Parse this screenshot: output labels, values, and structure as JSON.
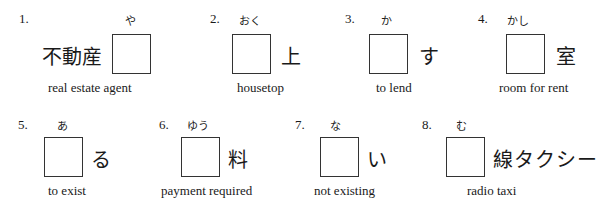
{
  "items": [
    {
      "number": "1.",
      "furigana": "や",
      "before": "不動産",
      "after": "",
      "meaning": "real estate agent"
    },
    {
      "number": "2.",
      "furigana": "おく",
      "before": "",
      "after": "上",
      "meaning": "housetop"
    },
    {
      "number": "3.",
      "furigana": "か",
      "before": "",
      "after": "す",
      "meaning": "to lend"
    },
    {
      "number": "4.",
      "furigana": "かし",
      "before": "",
      "after": "室",
      "meaning": "room for rent"
    },
    {
      "number": "5.",
      "furigana": "あ",
      "before": "",
      "after": "る",
      "meaning": "to exist"
    },
    {
      "number": "6.",
      "furigana": "ゆう",
      "before": "",
      "after": "料",
      "meaning": "payment required"
    },
    {
      "number": "7.",
      "furigana": "な",
      "before": "",
      "after": "い",
      "meaning": "not existing"
    },
    {
      "number": "8.",
      "furigana": "む",
      "before": "",
      "after": "線タクシー",
      "meaning": "radio taxi"
    }
  ]
}
